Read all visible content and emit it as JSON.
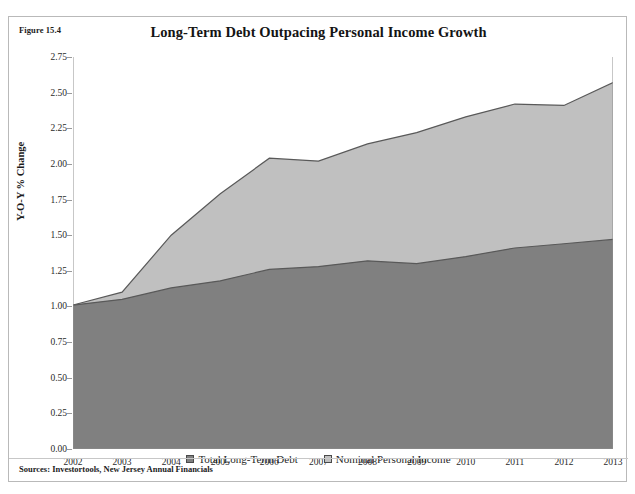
{
  "figure": {
    "label": "Figure 15.4",
    "title": "Long-Term Debt Outpacing Personal Income Growth",
    "sources": "Sources: Investortools, New Jersey Annual Financials"
  },
  "legend": {
    "position": "bottom-center",
    "items": [
      {
        "label": "Total Long-Term Debt",
        "color": "#808080"
      },
      {
        "label": "Nominal Personal Income",
        "color": "#c0c0c0"
      }
    ]
  },
  "colors": {
    "debt_fill": "#808080",
    "income_fill": "#c0c0c0",
    "series_line": "#595959",
    "axis": "#8f8f8f",
    "text": "#1b1b1b",
    "frame": "#b9b9b9"
  },
  "chart_data": {
    "type": "area",
    "stacked": false,
    "title": "Long-Term Debt Outpacing Personal Income Growth",
    "xlabel": "",
    "ylabel": "Y-O-Y % Change",
    "categories": [
      "2002",
      "2003",
      "2004",
      "2005",
      "2006",
      "2007",
      "2008",
      "2009",
      "2010",
      "2011",
      "2012",
      "2013"
    ],
    "x_ticklabels": [
      "2002",
      "2003",
      "2004",
      "2005",
      "2006",
      "2007",
      "2008",
      "2009",
      "2010",
      "2011",
      "2012",
      "2013"
    ],
    "y_ticklabels": [
      "0.00",
      "0.25",
      "0.50",
      "0.75",
      "1.00",
      "1.25",
      "1.50",
      "1.75",
      "2.00",
      "2.25",
      "2.50",
      "2.75"
    ],
    "ylim": [
      0.0,
      2.75
    ],
    "ytick_step": 0.25,
    "grid": false,
    "series": [
      {
        "name": "Nominal Personal Income",
        "color": "#c0c0c0",
        "values": [
          1.01,
          1.1,
          1.5,
          1.79,
          2.04,
          2.02,
          2.14,
          2.22,
          2.33,
          2.42,
          2.41,
          2.57
        ]
      },
      {
        "name": "Total Long-Term Debt",
        "color": "#808080",
        "values": [
          1.01,
          1.05,
          1.13,
          1.18,
          1.26,
          1.28,
          1.32,
          1.3,
          1.35,
          1.41,
          1.44,
          1.47
        ]
      }
    ]
  }
}
